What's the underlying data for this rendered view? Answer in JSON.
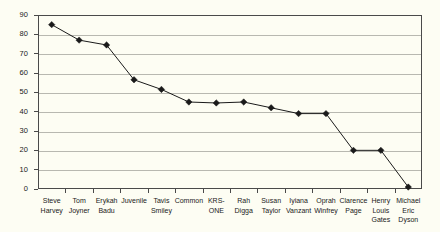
{
  "chart_data": {
    "type": "line",
    "title": "",
    "xlabel": "",
    "ylabel": "",
    "ylim": [
      0,
      90
    ],
    "ytick_step": 10,
    "yticks": [
      0,
      10,
      20,
      30,
      40,
      50,
      60,
      70,
      80,
      90
    ],
    "grid": true,
    "legend": "none",
    "marker": "diamond",
    "categories": [
      "Steve Harvey",
      "Tom Joyner",
      "Erykah Badu",
      "Juvenile",
      "Tavis Smiley",
      "Common",
      "KRS-ONE",
      "Rah Digga",
      "Susan Taylor",
      "Iyiana Vanzant",
      "Oprah Winfrey",
      "Clarence Page",
      "Henry Louis Gates",
      "Michael Eric Dyson"
    ],
    "category_lines": [
      [
        "Steve",
        "Harvey"
      ],
      [
        "Tom",
        "Joyner"
      ],
      [
        "Erykah",
        "Badu"
      ],
      [
        "Juvenile"
      ],
      [
        "Tavis",
        "Smiley"
      ],
      [
        "Common"
      ],
      [
        "KRS-",
        "ONE"
      ],
      [
        "Rah",
        "Digga"
      ],
      [
        "Susan",
        "Taylor"
      ],
      [
        "Iyiana",
        "Vanzant"
      ],
      [
        "Oprah",
        "Winfrey"
      ],
      [
        "Clarence",
        "Page"
      ],
      [
        "Henry",
        "Louis",
        "Gates"
      ],
      [
        "Michael",
        "Eric",
        "Dyson"
      ]
    ],
    "values": [
      85,
      77,
      74.5,
      56.5,
      51.5,
      45,
      44.5,
      45,
      42,
      39,
      39,
      20,
      20,
      1
    ],
    "colors": {
      "background": "#fdfdf3",
      "plot_background": "#fdfdf3",
      "axis": "#4a4a4a",
      "gridline": "#b8b8b0",
      "series": "#1a1a1a",
      "text": "#1a1a1a"
    }
  }
}
